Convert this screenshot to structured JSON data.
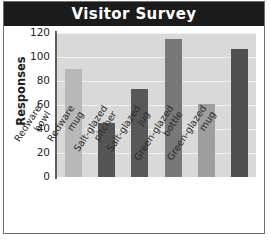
{
  "chart_data": {
    "type": "bar",
    "title": "Visitor Survey",
    "xlabel": "",
    "ylabel": "Responses",
    "categories": [
      "Redware bowl",
      "Redware mug",
      "Salt-glazed pitcher",
      "Salt-glazed jug",
      "Green-glazed bottle",
      "Green-glazed mug"
    ],
    "category_lines": [
      [
        "Redware",
        "bowl"
      ],
      [
        "Redware",
        "mug"
      ],
      [
        "Salt-glazed",
        "pitcher"
      ],
      [
        "Salt-glazed",
        "jug"
      ],
      [
        "Green-glazed",
        "bottle"
      ],
      [
        "Green-glazed",
        "mug"
      ]
    ],
    "values": [
      90,
      45,
      73,
      115,
      61,
      107
    ],
    "bar_colors": [
      "#b8b8b8",
      "#555555",
      "#585858",
      "#787878",
      "#9e9e9e",
      "#4f4f4f"
    ],
    "ylim": [
      0,
      120
    ],
    "yticks": [
      0,
      20,
      40,
      60,
      80,
      100,
      120
    ],
    "ytick_labels": [
      "0",
      "20",
      "40",
      "60",
      "80",
      "100",
      "120"
    ],
    "grid": true,
    "legend": "none",
    "plot_background": "#d9d9d9",
    "title_background": "#1b1b1b",
    "title_color": "#ffffff"
  }
}
